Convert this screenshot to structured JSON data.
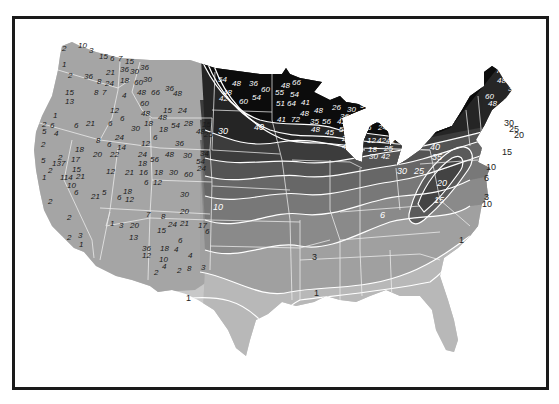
{
  "map": {
    "title": "",
    "subject": "Contiguous United States snowfall/precipitation contour map (grayscale)",
    "colors": {
      "frame": "#1a1a1a",
      "background": "#ffffff",
      "west_fill": "#a6a6a6",
      "band_heaviest": "#0d0d0d",
      "band_40": "#262626",
      "band_30": "#3c3c3c",
      "band_20": "#555555",
      "band_15": "#686868",
      "band_10": "#787878",
      "band_6": "#8a8a8a",
      "band_3": "#a0a0a0",
      "band_1": "#b8b8b8",
      "band_lt1": "#c8c8c8",
      "contour_line": "#ffffff",
      "state_line": "#f0f0f0"
    },
    "contour_labels": [
      {
        "text": "30",
        "x": 199,
        "y": 61
      },
      {
        "text": "35",
        "x": 214,
        "y": 64
      },
      {
        "text": "40",
        "x": 228,
        "y": 67
      },
      {
        "text": "40",
        "x": 254,
        "y": 130
      },
      {
        "text": "30",
        "x": 218,
        "y": 134
      },
      {
        "text": "40",
        "x": 430,
        "y": 150
      },
      {
        "text": "35",
        "x": 432,
        "y": 160
      },
      {
        "text": "30",
        "x": 397,
        "y": 174
      },
      {
        "text": "25",
        "x": 414,
        "y": 174
      },
      {
        "text": "20",
        "x": 437,
        "y": 186
      },
      {
        "text": "15",
        "x": 434,
        "y": 203
      },
      {
        "text": "10",
        "x": 486,
        "y": 170
      },
      {
        "text": "6",
        "x": 484,
        "y": 181
      },
      {
        "text": "3",
        "x": 484,
        "y": 200
      },
      {
        "text": "10",
        "x": 482,
        "y": 207
      },
      {
        "text": "30",
        "x": 504,
        "y": 126
      },
      {
        "text": "25",
        "x": 509,
        "y": 132
      },
      {
        "text": "20",
        "x": 514,
        "y": 138
      },
      {
        "text": "15",
        "x": 502,
        "y": 155
      },
      {
        "text": "30",
        "x": 393,
        "y": 138
      },
      {
        "text": "6",
        "x": 380,
        "y": 218
      },
      {
        "text": "3",
        "x": 312,
        "y": 260
      },
      {
        "text": "1",
        "x": 459,
        "y": 243
      },
      {
        "text": "1",
        "x": 314,
        "y": 296
      },
      {
        "text": "1",
        "x": 186,
        "y": 301
      },
      {
        "text": "10",
        "x": 213,
        "y": 210
      }
    ],
    "station_values_west": [
      {
        "text": "2",
        "x": 62,
        "y": 51
      },
      {
        "text": "10",
        "x": 78,
        "y": 48
      },
      {
        "text": "3",
        "x": 89,
        "y": 53
      },
      {
        "text": "15",
        "x": 99,
        "y": 59
      },
      {
        "text": "6",
        "x": 110,
        "y": 61
      },
      {
        "text": "7",
        "x": 118,
        "y": 61
      },
      {
        "text": "15",
        "x": 125,
        "y": 64
      },
      {
        "text": "36",
        "x": 120,
        "y": 72
      },
      {
        "text": "30",
        "x": 130,
        "y": 74
      },
      {
        "text": "36",
        "x": 140,
        "y": 70
      },
      {
        "text": "1",
        "x": 62,
        "y": 67
      },
      {
        "text": "2",
        "x": 68,
        "y": 78
      },
      {
        "text": "36",
        "x": 84,
        "y": 79
      },
      {
        "text": "21",
        "x": 106,
        "y": 75
      },
      {
        "text": "8",
        "x": 97,
        "y": 84
      },
      {
        "text": "24",
        "x": 105,
        "y": 86
      },
      {
        "text": "18",
        "x": 120,
        "y": 83
      },
      {
        "text": "60",
        "x": 134,
        "y": 85
      },
      {
        "text": "30",
        "x": 143,
        "y": 82
      },
      {
        "text": "15",
        "x": 65,
        "y": 95
      },
      {
        "text": "13",
        "x": 65,
        "y": 104
      },
      {
        "text": "8",
        "x": 94,
        "y": 95
      },
      {
        "text": "7",
        "x": 102,
        "y": 95
      },
      {
        "text": "4",
        "x": 122,
        "y": 98
      },
      {
        "text": "48",
        "x": 137,
        "y": 95
      },
      {
        "text": "66",
        "x": 151,
        "y": 95
      },
      {
        "text": "36",
        "x": 165,
        "y": 91
      },
      {
        "text": "48",
        "x": 173,
        "y": 96
      },
      {
        "text": "60",
        "x": 140,
        "y": 106
      },
      {
        "text": "48",
        "x": 141,
        "y": 116
      },
      {
        "text": "12",
        "x": 110,
        "y": 113
      },
      {
        "text": "15",
        "x": 163,
        "y": 113
      },
      {
        "text": "24",
        "x": 178,
        "y": 113
      },
      {
        "text": "1",
        "x": 53,
        "y": 118
      },
      {
        "text": "6",
        "x": 120,
        "y": 121
      },
      {
        "text": "2",
        "x": 42,
        "y": 127
      },
      {
        "text": "6",
        "x": 50,
        "y": 128
      },
      {
        "text": "5",
        "x": 42,
        "y": 134
      },
      {
        "text": "4",
        "x": 54,
        "y": 136
      },
      {
        "text": "6",
        "x": 74,
        "y": 128
      },
      {
        "text": "21",
        "x": 86,
        "y": 126
      },
      {
        "text": "6",
        "x": 108,
        "y": 126
      },
      {
        "text": "18",
        "x": 144,
        "y": 126
      },
      {
        "text": "30",
        "x": 131,
        "y": 131
      },
      {
        "text": "48",
        "x": 158,
        "y": 120
      },
      {
        "text": "18",
        "x": 159,
        "y": 132
      },
      {
        "text": "54",
        "x": 171,
        "y": 128
      },
      {
        "text": "28",
        "x": 184,
        "y": 126
      },
      {
        "text": "15",
        "x": 202,
        "y": 127
      },
      {
        "text": "48",
        "x": 196,
        "y": 134
      },
      {
        "text": "25",
        "x": 204,
        "y": 137
      },
      {
        "text": "2",
        "x": 41,
        "y": 147
      },
      {
        "text": "8",
        "x": 96,
        "y": 143
      },
      {
        "text": "18",
        "x": 75,
        "y": 152
      },
      {
        "text": "6",
        "x": 107,
        "y": 147
      },
      {
        "text": "14",
        "x": 117,
        "y": 150
      },
      {
        "text": "24",
        "x": 115,
        "y": 140
      },
      {
        "text": "12",
        "x": 141,
        "y": 146
      },
      {
        "text": "6",
        "x": 153,
        "y": 140
      },
      {
        "text": "36",
        "x": 175,
        "y": 146
      },
      {
        "text": "5",
        "x": 41,
        "y": 163
      },
      {
        "text": "2",
        "x": 58,
        "y": 160
      },
      {
        "text": "137",
        "x": 52,
        "y": 166
      },
      {
        "text": "17",
        "x": 71,
        "y": 162
      },
      {
        "text": "20",
        "x": 93,
        "y": 157
      },
      {
        "text": "22",
        "x": 110,
        "y": 157
      },
      {
        "text": "24",
        "x": 138,
        "y": 157
      },
      {
        "text": "56",
        "x": 150,
        "y": 162
      },
      {
        "text": "48",
        "x": 165,
        "y": 157
      },
      {
        "text": "30",
        "x": 183,
        "y": 158
      },
      {
        "text": "34",
        "x": 200,
        "y": 156
      },
      {
        "text": "54",
        "x": 196,
        "y": 164
      },
      {
        "text": "24",
        "x": 197,
        "y": 171
      },
      {
        "text": "2",
        "x": 48,
        "y": 173
      },
      {
        "text": "15",
        "x": 72,
        "y": 172
      },
      {
        "text": "21",
        "x": 76,
        "y": 179
      },
      {
        "text": "1",
        "x": 42,
        "y": 180
      },
      {
        "text": "114",
        "x": 60,
        "y": 180
      },
      {
        "text": "12",
        "x": 106,
        "y": 174
      },
      {
        "text": "18",
        "x": 138,
        "y": 166
      },
      {
        "text": "21",
        "x": 125,
        "y": 175
      },
      {
        "text": "16",
        "x": 139,
        "y": 175
      },
      {
        "text": "18",
        "x": 154,
        "y": 175
      },
      {
        "text": "30",
        "x": 169,
        "y": 175
      },
      {
        "text": "60",
        "x": 184,
        "y": 177
      },
      {
        "text": "10",
        "x": 67,
        "y": 188
      },
      {
        "text": "6",
        "x": 74,
        "y": 195
      },
      {
        "text": "6",
        "x": 144,
        "y": 185
      },
      {
        "text": "12",
        "x": 153,
        "y": 185
      },
      {
        "text": "21",
        "x": 91,
        "y": 199
      },
      {
        "text": "5",
        "x": 102,
        "y": 195
      },
      {
        "text": "6",
        "x": 117,
        "y": 200
      },
      {
        "text": "18",
        "x": 123,
        "y": 194
      },
      {
        "text": "12",
        "x": 125,
        "y": 202
      },
      {
        "text": "30",
        "x": 180,
        "y": 197
      },
      {
        "text": "2",
        "x": 48,
        "y": 204
      },
      {
        "text": "20",
        "x": 180,
        "y": 214
      },
      {
        "text": "2",
        "x": 67,
        "y": 220
      },
      {
        "text": "7",
        "x": 146,
        "y": 217
      },
      {
        "text": "8",
        "x": 161,
        "y": 219
      },
      {
        "text": "1",
        "x": 110,
        "y": 226
      },
      {
        "text": "3",
        "x": 119,
        "y": 228
      },
      {
        "text": "20",
        "x": 130,
        "y": 228
      },
      {
        "text": "24",
        "x": 168,
        "y": 227
      },
      {
        "text": "21",
        "x": 180,
        "y": 226
      },
      {
        "text": "17",
        "x": 198,
        "y": 228
      },
      {
        "text": "6",
        "x": 205,
        "y": 234
      },
      {
        "text": "15",
        "x": 157,
        "y": 233
      },
      {
        "text": "2",
        "x": 67,
        "y": 240
      },
      {
        "text": "13",
        "x": 129,
        "y": 240
      },
      {
        "text": "6",
        "x": 178,
        "y": 243
      },
      {
        "text": "3",
        "x": 78,
        "y": 238
      },
      {
        "text": "1",
        "x": 79,
        "y": 247
      },
      {
        "text": "36",
        "x": 142,
        "y": 251
      },
      {
        "text": "18",
        "x": 160,
        "y": 251
      },
      {
        "text": "4",
        "x": 174,
        "y": 252
      },
      {
        "text": "12",
        "x": 142,
        "y": 258
      },
      {
        "text": "4",
        "x": 188,
        "y": 258
      },
      {
        "text": "10",
        "x": 159,
        "y": 262
      },
      {
        "text": "4",
        "x": 162,
        "y": 269
      },
      {
        "text": "2",
        "x": 154,
        "y": 275
      },
      {
        "text": "2",
        "x": 177,
        "y": 273
      },
      {
        "text": "8",
        "x": 187,
        "y": 271
      },
      {
        "text": "3",
        "x": 201,
        "y": 270
      }
    ],
    "station_values_east": [
      {
        "text": "54",
        "x": 218,
        "y": 82
      },
      {
        "text": "48",
        "x": 232,
        "y": 86
      },
      {
        "text": "36",
        "x": 249,
        "y": 86
      },
      {
        "text": "60",
        "x": 261,
        "y": 92
      },
      {
        "text": "48",
        "x": 223,
        "y": 95
      },
      {
        "text": "42",
        "x": 219,
        "y": 101
      },
      {
        "text": "60",
        "x": 239,
        "y": 104
      },
      {
        "text": "54",
        "x": 252,
        "y": 100
      },
      {
        "text": "48",
        "x": 281,
        "y": 88
      },
      {
        "text": "66",
        "x": 292,
        "y": 85
      },
      {
        "text": "55",
        "x": 275,
        "y": 95
      },
      {
        "text": "54",
        "x": 290,
        "y": 97
      },
      {
        "text": "51",
        "x": 276,
        "y": 106
      },
      {
        "text": "64",
        "x": 287,
        "y": 106
      },
      {
        "text": "41",
        "x": 301,
        "y": 105
      },
      {
        "text": "41",
        "x": 277,
        "y": 122
      },
      {
        "text": "72",
        "x": 291,
        "y": 122
      },
      {
        "text": "48",
        "x": 300,
        "y": 116
      },
      {
        "text": "48",
        "x": 314,
        "y": 113
      },
      {
        "text": "26",
        "x": 332,
        "y": 110
      },
      {
        "text": "30",
        "x": 347,
        "y": 112
      },
      {
        "text": "9",
        "x": 360,
        "y": 108
      },
      {
        "text": "36",
        "x": 340,
        "y": 119
      },
      {
        "text": "35",
        "x": 310,
        "y": 124
      },
      {
        "text": "56",
        "x": 322,
        "y": 124
      },
      {
        "text": "42",
        "x": 337,
        "y": 124
      },
      {
        "text": "48",
        "x": 311,
        "y": 132
      },
      {
        "text": "45",
        "x": 325,
        "y": 135
      },
      {
        "text": "54",
        "x": 339,
        "y": 132
      },
      {
        "text": "24",
        "x": 342,
        "y": 141
      },
      {
        "text": "42",
        "x": 342,
        "y": 149
      },
      {
        "text": "36",
        "x": 372,
        "y": 123
      },
      {
        "text": "24",
        "x": 378,
        "y": 130
      },
      {
        "text": "6",
        "x": 367,
        "y": 130
      },
      {
        "text": "12",
        "x": 367,
        "y": 143
      },
      {
        "text": "42",
        "x": 377,
        "y": 143
      },
      {
        "text": "42",
        "x": 386,
        "y": 143
      },
      {
        "text": "18",
        "x": 368,
        "y": 152
      },
      {
        "text": "25",
        "x": 384,
        "y": 151
      },
      {
        "text": "30",
        "x": 369,
        "y": 159
      },
      {
        "text": "42",
        "x": 381,
        "y": 159
      },
      {
        "text": "72",
        "x": 496,
        "y": 73
      },
      {
        "text": "48",
        "x": 497,
        "y": 83
      },
      {
        "text": "36",
        "x": 508,
        "y": 91
      },
      {
        "text": "60",
        "x": 485,
        "y": 99
      },
      {
        "text": "48",
        "x": 488,
        "y": 106
      }
    ]
  }
}
